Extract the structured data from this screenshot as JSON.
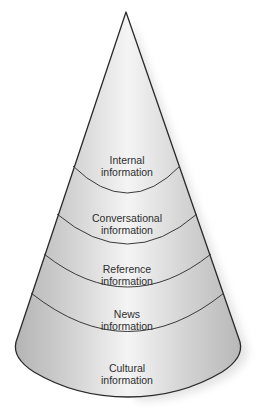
{
  "diagram": {
    "type": "cone",
    "colors": {
      "outline": "#2a2a2a",
      "fill_center": "#f4f4f4",
      "fill_edge": "#b9b9b9",
      "text": "#2e2e2e"
    },
    "layers": [
      {
        "line1": "Internal",
        "line2": "information"
      },
      {
        "line1": "Conversational",
        "line2": "information"
      },
      {
        "line1": "Reference",
        "line2": "information"
      },
      {
        "line1": "News",
        "line2": "information"
      },
      {
        "line1": "Cultural",
        "line2": "information"
      }
    ]
  }
}
